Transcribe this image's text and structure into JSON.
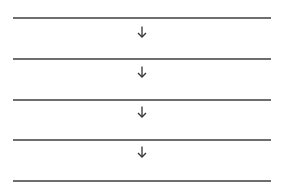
{
  "diagram": {
    "type": "vertical-flow",
    "line_color": "#6e6e6e",
    "arrow_color": "#333333",
    "lines": [
      {
        "y": 17
      },
      {
        "y": 58
      },
      {
        "y": 99
      },
      {
        "y": 139
      },
      {
        "y": 180
      }
    ],
    "arrows": [
      {
        "icon": "arrow-down-icon",
        "y": 26
      },
      {
        "icon": "arrow-down-icon",
        "y": 66
      },
      {
        "icon": "arrow-down-icon",
        "y": 106
      },
      {
        "icon": "arrow-down-icon",
        "y": 146
      }
    ]
  }
}
